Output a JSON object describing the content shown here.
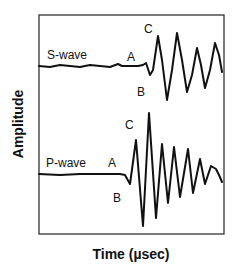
{
  "chart_data": {
    "type": "line",
    "title": "",
    "xlabel": "Time (µsec)",
    "ylabel": "Amplitude",
    "grid": false,
    "legend": "none",
    "axis_ticks": "none",
    "series": [
      {
        "name": "S-wave",
        "label": "S-wave",
        "description": "Shear wave trace; flat baseline then oscillation starting near onset A, first trough B, first peak C",
        "points_px": [
          [
            39,
            66
          ],
          [
            50,
            67
          ],
          [
            60,
            65
          ],
          [
            70,
            66
          ],
          [
            80,
            67
          ],
          [
            90,
            65
          ],
          [
            100,
            66
          ],
          [
            110,
            67
          ],
          [
            118,
            64
          ],
          [
            122,
            66
          ],
          [
            130,
            66
          ],
          [
            138,
            66
          ],
          [
            143,
            65
          ],
          [
            146,
            63
          ],
          [
            150,
            75
          ],
          [
            153,
            70
          ],
          [
            158,
            36
          ],
          [
            162,
            60
          ],
          [
            167,
            100
          ],
          [
            172,
            70
          ],
          [
            177,
            33
          ],
          [
            182,
            60
          ],
          [
            187,
            92
          ],
          [
            192,
            75
          ],
          [
            197,
            48
          ],
          [
            201,
            65
          ],
          [
            205,
            88
          ],
          [
            210,
            70
          ],
          [
            215,
            43
          ],
          [
            219,
            55
          ],
          [
            222,
            72
          ]
        ],
        "markers": [
          {
            "text": "A",
            "x": 132,
            "y": 57
          },
          {
            "text": "B",
            "x": 141,
            "y": 92
          },
          {
            "text": "C",
            "x": 148,
            "y": 30
          }
        ]
      },
      {
        "name": "P-wave",
        "label": "P-wave",
        "description": "Compressional wave trace; flat baseline then larger oscillation starting near onset A, first trough B, peak C",
        "points_px": [
          [
            39,
            174
          ],
          [
            60,
            175
          ],
          [
            80,
            174
          ],
          [
            100,
            174
          ],
          [
            120,
            174
          ],
          [
            125,
            175
          ],
          [
            130,
            184
          ],
          [
            136,
            140
          ],
          [
            143,
            226
          ],
          [
            149,
            113
          ],
          [
            156,
            218
          ],
          [
            162,
            144
          ],
          [
            168,
            203
          ],
          [
            174,
            147
          ],
          [
            180,
            197
          ],
          [
            188,
            149
          ],
          [
            193,
            193
          ],
          [
            200,
            159
          ],
          [
            205,
            184
          ],
          [
            211,
            166
          ],
          [
            216,
            169
          ],
          [
            219,
            175
          ],
          [
            222,
            182
          ]
        ],
        "markers": [
          {
            "text": "A",
            "x": 112,
            "y": 163
          },
          {
            "text": "B",
            "x": 117,
            "y": 198
          },
          {
            "text": "C",
            "x": 129,
            "y": 126
          }
        ]
      }
    ],
    "frame": {
      "x0": 39,
      "y0": 15,
      "x1": 224,
      "y1": 234
    }
  },
  "labels": {
    "s_wave": "S-wave",
    "p_wave": "P-wave",
    "s_a": "A",
    "s_b": "B",
    "s_c": "C",
    "p_a": "A",
    "p_b": "B",
    "p_c": "C",
    "x_axis": "Time (µsec)",
    "y_axis": "Amplitude"
  }
}
